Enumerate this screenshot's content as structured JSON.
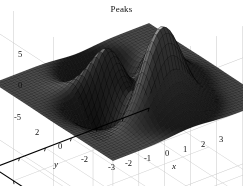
{
  "figure": {
    "background_color": "#ffffff",
    "width": 243,
    "height": 186
  },
  "chart_data": {
    "type": "surface",
    "title": "Peaks",
    "xlabel": "x",
    "ylabel": "y",
    "zlabel": "",
    "xlim": [
      -3,
      3
    ],
    "ylim": [
      -3,
      3
    ],
    "zlim": [
      -8,
      8
    ],
    "xticks": [
      -3,
      -2,
      -1,
      0,
      1,
      2,
      3
    ],
    "xticklabels": [
      "-3",
      "-2",
      "-1",
      "0",
      "1",
      "2",
      "3"
    ],
    "yticks": [
      -2,
      0,
      2
    ],
    "yticklabels": [
      "-2",
      "0",
      "2"
    ],
    "zticks": [
      -5,
      0,
      5
    ],
    "zticklabels": [
      "-5",
      "0",
      "5"
    ],
    "function": "peaks",
    "formula": "z = 3*(1-x)^2*exp(-x^2-(y+1)^2) - 10*(x/5 - x^3 - y^5)*exp(-x^2-y^2) - (1/3)*exp(-(x+1)^2 - y^2)",
    "grid": true,
    "grid_color": "#c8c8c8",
    "mesh_resolution": 49,
    "colormap": "gray",
    "surface_edge_color": "#000000",
    "axis_line_color": "#000000",
    "view_azimuth": -37.5,
    "view_elevation": 30,
    "extrema": {
      "z_max": 8.1,
      "z_min": -6.5,
      "peak_location": [
        -0.01,
        1.58
      ],
      "valley_location": [
        0.23,
        -1.63
      ]
    }
  },
  "labels": {
    "title": "Peaks",
    "x_axis_name": "x",
    "y_axis_name": "y",
    "z_ticks": [
      "5",
      "0",
      "-5"
    ],
    "x_ticks": [
      "-3",
      "-2",
      "-1",
      "0",
      "1",
      "2",
      "3"
    ],
    "y_ticks": [
      "2",
      "0",
      "-2"
    ]
  }
}
